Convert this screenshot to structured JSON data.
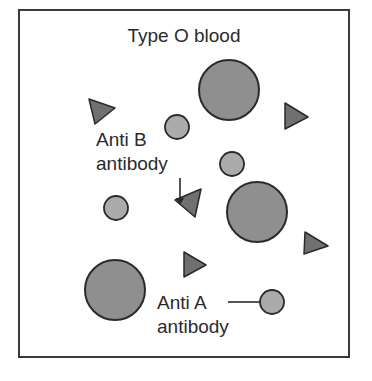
{
  "title": "Type O blood",
  "labels": {
    "anti_b_line1": "Anti B",
    "anti_b_line2": "antibody",
    "anti_a_line1": "Anti A",
    "anti_a_line2": "antibody"
  },
  "colors": {
    "border": "#3a3a3a",
    "large_circle_fill": "#8f8f8f",
    "small_circle_fill": "#ababab",
    "triangle_fill": "#707070",
    "stroke": "#2a2a2a",
    "text": "#2b2b2b"
  },
  "shapes": {
    "large_circles": [
      {
        "cx": 229,
        "cy": 90,
        "r": 30
      },
      {
        "cx": 257,
        "cy": 212,
        "r": 30
      },
      {
        "cx": 115,
        "cy": 290,
        "r": 30
      }
    ],
    "small_circles": [
      {
        "cx": 177,
        "cy": 127,
        "r": 12
      },
      {
        "cx": 232,
        "cy": 164,
        "r": 12
      },
      {
        "cx": 116,
        "cy": 208,
        "r": 12
      },
      {
        "cx": 272,
        "cy": 302,
        "r": 12
      }
    ],
    "triangles": [
      "89,99 115,108 95,124",
      "285,103 308,117 285,129",
      "175,200 201,189 195,217",
      "305,232 328,246 304,254",
      "184,252 206,265 184,277"
    ]
  }
}
